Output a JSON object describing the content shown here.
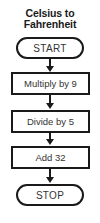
{
  "title": {
    "line1": "Celsius to",
    "line2": "Fahrenheit"
  },
  "flowchart": {
    "start": "START",
    "steps": [
      "Multiply by 9",
      "Divide by 5",
      "Add 32"
    ],
    "stop": "STOP"
  }
}
